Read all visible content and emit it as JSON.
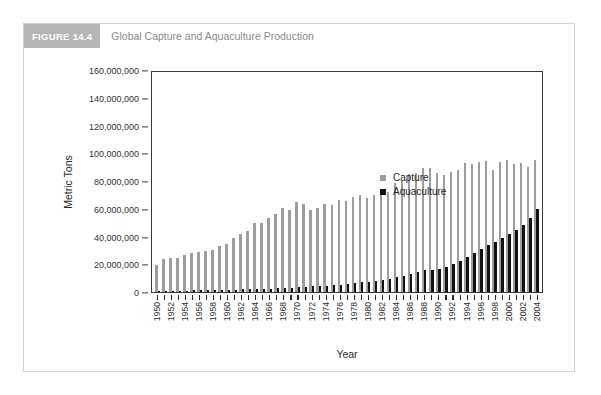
{
  "figure": {
    "badge": "FIGURE 14.4",
    "title": "Global Capture and Aquaculture Production"
  },
  "colors": {
    "badge_bg": "#b5b5b5",
    "title_text": "#8a8a8a",
    "capture": "#9d9d9d",
    "aquaculture": "#111111",
    "axis": "#3a3a3a",
    "card_border": "#d3d3d3"
  },
  "legend": {
    "position": "inside-upper-left",
    "entries": [
      {
        "label": "Capture",
        "color": "#9d9d9d"
      },
      {
        "label": "Aquaculture",
        "color": "#111111"
      }
    ]
  },
  "axes": {
    "y_title": "Metric Tons",
    "x_title": "Year",
    "y_ticks": [
      "0",
      "20,000,000",
      "40,000,000",
      "60,000,000",
      "80,000,000",
      "100,000,000",
      "120,000,000",
      "140,000,000",
      "160,000,000"
    ]
  },
  "chart_data": {
    "type": "bar",
    "title": "Global Capture and Aquaculture Production",
    "xlabel": "Year",
    "ylabel": "Metric Tons",
    "ylim": [
      0,
      160000000
    ],
    "ytick_interval": 20000000,
    "grid": false,
    "legend_position": "inside-upper-left",
    "bar_mode": "grouped",
    "categories": [
      "1950",
      "1951",
      "1952",
      "1953",
      "1954",
      "1955",
      "1956",
      "1957",
      "1958",
      "1959",
      "1960",
      "1961",
      "1962",
      "1963",
      "1964",
      "1965",
      "1966",
      "1967",
      "1968",
      "1969",
      "1970",
      "1971",
      "1972",
      "1973",
      "1974",
      "1975",
      "1976",
      "1977",
      "1978",
      "1979",
      "1980",
      "1981",
      "1982",
      "1983",
      "1984",
      "1985",
      "1986",
      "1987",
      "1988",
      "1989",
      "1990",
      "1991",
      "1992",
      "1993",
      "1994",
      "1995",
      "1996",
      "1997",
      "1998",
      "1999",
      "2000",
      "2001",
      "2002",
      "2003",
      "2004"
    ],
    "tick_labels_shown": [
      "1950",
      "1952",
      "1954",
      "1956",
      "1958",
      "1960",
      "1962",
      "1964",
      "1966",
      "1968",
      "1970",
      "1972",
      "1974",
      "1976",
      "1978",
      "1980",
      "1982",
      "1984",
      "1986",
      "1988",
      "1990",
      "1992",
      "1994",
      "1996",
      "1998",
      "2000",
      "2002",
      "2004"
    ],
    "series": [
      {
        "name": "Capture",
        "color": "#9d9d9d",
        "values": [
          19300000,
          23600000,
          24300000,
          24700000,
          26700000,
          27800000,
          29200000,
          29400000,
          30400000,
          33000000,
          34500000,
          39100000,
          42000000,
          44200000,
          49400000,
          49900000,
          53700000,
          56200000,
          60500000,
          59400000,
          64600000,
          63600000,
          59300000,
          60300000,
          63400000,
          62700000,
          66500000,
          65900000,
          68500000,
          69700000,
          68000000,
          70200000,
          71700000,
          72200000,
          78600000,
          79800000,
          85400000,
          85600000,
          89500000,
          89300000,
          85900000,
          84600000,
          86400000,
          88200000,
          92700000,
          92600000,
          93800000,
          94300000,
          87600000,
          93800000,
          95500000,
          92400000,
          93000000,
          90200000,
          95000000
        ]
      },
      {
        "name": "Aquaculture",
        "color": "#111111",
        "values": [
          600000,
          700000,
          800000,
          900000,
          1000000,
          1100000,
          1200000,
          1300000,
          1400000,
          1500000,
          1700000,
          1800000,
          1900000,
          2000000,
          2200000,
          2400000,
          2500000,
          2700000,
          2900000,
          3100000,
          3500000,
          3700000,
          4000000,
          4200000,
          4600000,
          5000000,
          5400000,
          5700000,
          6300000,
          6900000,
          7400000,
          8100000,
          8700000,
          9600000,
          10500000,
          11600000,
          12800000,
          14300000,
          15600000,
          16100000,
          16800000,
          18000000,
          19900000,
          22400000,
          25000000,
          28000000,
          31000000,
          34000000,
          36000000,
          39000000,
          42000000,
          45000000,
          48000000,
          53000000,
          59500000
        ]
      }
    ]
  }
}
